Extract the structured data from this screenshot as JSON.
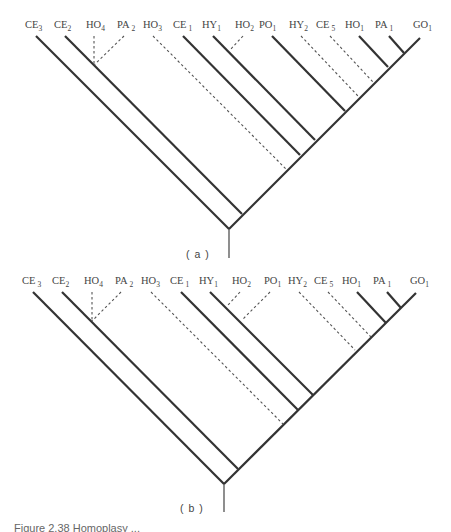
{
  "figure": {
    "caption": "Figure 2.38 Homoplasy ...",
    "panels": [
      {
        "id": "a",
        "label": "( a )",
        "taxa": [
          {
            "name": "CE",
            "sub": "3",
            "branch": "solid"
          },
          {
            "name": "CE",
            "sub": "2",
            "branch": "solid"
          },
          {
            "name": "HO",
            "sub": "4",
            "branch": "dashed"
          },
          {
            "name": "PA",
            "sub": "2",
            "branch": "dashed"
          },
          {
            "name": "HO",
            "sub": "3",
            "branch": "dashed"
          },
          {
            "name": "CE",
            "sub": "1",
            "branch": "solid"
          },
          {
            "name": "HY",
            "sub": "1",
            "branch": "solid"
          },
          {
            "name": "HO",
            "sub": "2",
            "branch": "dashed"
          },
          {
            "name": "PO",
            "sub": "1",
            "branch": "solid"
          },
          {
            "name": "HY",
            "sub": "2",
            "branch": "dashed"
          },
          {
            "name": "CE",
            "sub": "5",
            "branch": "dashed"
          },
          {
            "name": "HO",
            "sub": "1",
            "branch": "solid"
          },
          {
            "name": "PA",
            "sub": "1",
            "branch": "solid"
          },
          {
            "name": "GO",
            "sub": "1",
            "branch": "solid"
          }
        ]
      },
      {
        "id": "b",
        "label": "( b )",
        "taxa": [
          {
            "name": "CE",
            "sub": "3",
            "branch": "solid"
          },
          {
            "name": "CE",
            "sub": "2",
            "branch": "solid"
          },
          {
            "name": "HO",
            "sub": "4",
            "branch": "dashed"
          },
          {
            "name": "PA",
            "sub": "2",
            "branch": "dashed"
          },
          {
            "name": "HO",
            "sub": "3",
            "branch": "dashed"
          },
          {
            "name": "CE",
            "sub": "1",
            "branch": "solid"
          },
          {
            "name": "HY",
            "sub": "1",
            "branch": "solid"
          },
          {
            "name": "HO",
            "sub": "2",
            "branch": "dashed"
          },
          {
            "name": "PO",
            "sub": "1",
            "branch": "dashed"
          },
          {
            "name": "HY",
            "sub": "2",
            "branch": "dashed"
          },
          {
            "name": "CE",
            "sub": "5",
            "branch": "dashed"
          },
          {
            "name": "HO",
            "sub": "1",
            "branch": "solid"
          },
          {
            "name": "PA",
            "sub": "1",
            "branch": "solid"
          },
          {
            "name": "GO",
            "sub": "1",
            "branch": "solid"
          }
        ]
      }
    ]
  }
}
